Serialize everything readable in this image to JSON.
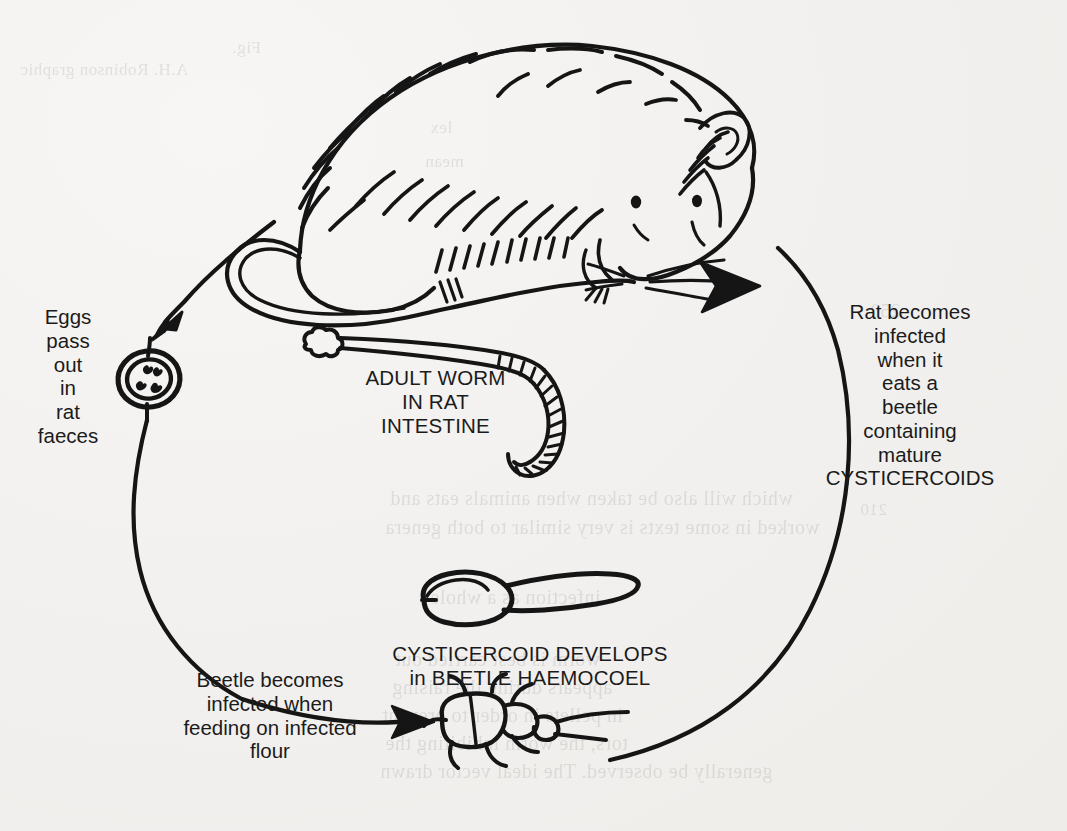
{
  "page": {
    "background_color": "#f1f0ee",
    "ink_color": "#151515"
  },
  "diagram": {
    "title_semantic": "life-cycle-of-rat-tapeworm",
    "captions": {
      "eggs": "Eggs\npass\nout\nin\nrat\nfaeces",
      "rat": "Rat becomes\ninfected\nwhen it\neats a\nbeetle\ncontaining\nmature\nCYSTICERCOIDS",
      "adult_worm": "ADULT WORM\nIN RAT\nINTESTINE",
      "cysticercoid": "CYSTICERCOID DEVELOPS\nin BEETLE HAEMOCOEL",
      "beetle": "Beetle becomes\ninfected when\nfeeding on infected\nflour"
    },
    "figures": [
      {
        "name": "rat",
        "label": "rat"
      },
      {
        "name": "tapeworm",
        "label": "adult worm"
      },
      {
        "name": "egg",
        "label": "egg with oncosphere hooks"
      },
      {
        "name": "cysticercoid",
        "label": "cysticercoid"
      },
      {
        "name": "beetle",
        "label": "flour beetle"
      }
    ],
    "arrows": [
      {
        "name": "rat-to-egg",
        "from": "rat",
        "to": "egg"
      },
      {
        "name": "egg-to-beetle",
        "from": "egg",
        "to": "beetle"
      },
      {
        "name": "beetle-to-rat",
        "from": "beetle",
        "to": "rat"
      }
    ]
  },
  "ghost_text": {
    "items": [
      {
        "text": "Fig.",
        "x": 232,
        "y": 38,
        "size": 17
      },
      {
        "text": "A.H. Robinson graphic",
        "x": 20,
        "y": 60,
        "size": 17
      },
      {
        "text": "250",
        "x": 870,
        "y": 300,
        "size": 19
      },
      {
        "text": "lex",
        "x": 430,
        "y": 118,
        "size": 17
      },
      {
        "text": "mean",
        "x": 425,
        "y": 152,
        "size": 17
      },
      {
        "text": "which will also be taken when animals eats and",
        "x": 390,
        "y": 487,
        "size": 20
      },
      {
        "text": "worked in some texts is very similar to both genera",
        "x": 385,
        "y": 516,
        "size": 20
      },
      {
        "text": "infection as a whole",
        "x": 430,
        "y": 586,
        "size": 20
      },
      {
        "text": "worm is best carried out",
        "x": 395,
        "y": 648,
        "size": 20
      },
      {
        "text": "appears during the raising",
        "x": 392,
        "y": 676,
        "size": 20
      },
      {
        "text": "in pellets in order to prevent",
        "x": 382,
        "y": 704,
        "size": 20
      },
      {
        "text": "tors, the worm inhibiting the",
        "x": 385,
        "y": 732,
        "size": 20
      },
      {
        "text": "generally be observed. The ideal vector drawn",
        "x": 380,
        "y": 760,
        "size": 20
      },
      {
        "text": "210",
        "x": 860,
        "y": 500,
        "size": 17
      }
    ]
  }
}
